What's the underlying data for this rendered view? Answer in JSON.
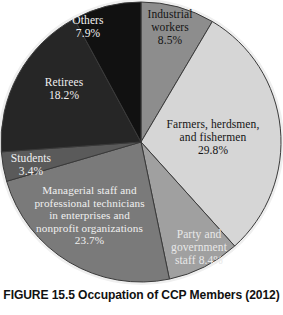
{
  "figure": {
    "caption": "FIGURE 15.5 Occupation of CCP Members (2012)",
    "background": "#ffffff"
  },
  "labels": {
    "industrial": "Industrial\nworkers\n8.5%",
    "farmers": "Farmers, herdsmen,\nand fishermen\n29.8%",
    "party": "Party and\ngovernment\nstaff 8.4%",
    "managerial": "Managerial staff and\nprofessional technicians\nin enterprises and\nnonprofit organizations\n23.7%",
    "students": "Students\n3.4%",
    "retirees": "Retirees\n18.2%",
    "others": "Others\n7.9%"
  },
  "chart_data": {
    "type": "pie",
    "title": "FIGURE 15.5 Occupation of CCP Members (2012)",
    "xlabel": "",
    "ylabel": "",
    "units": "percent",
    "start_angle_deg": 0,
    "direction": "clockwise",
    "legend": "none (labels placed on slices)",
    "categories": [
      "Industrial workers",
      "Farmers, herdsmen, and fishermen",
      "Party and government staff",
      "Managerial staff and professional technicians in enterprises and nonprofit organizations",
      "Students",
      "Retirees",
      "Others"
    ],
    "values": [
      8.5,
      29.8,
      8.4,
      23.7,
      3.4,
      18.2,
      7.9
    ],
    "value_labels": [
      "8.5%",
      "29.8%",
      "8.4%",
      "23.7%",
      "3.4%",
      "18.2%",
      "7.9%"
    ],
    "colors": [
      "#8d8d8d",
      "#d6d6d6",
      "#a0a0a0",
      "#7a7a7a",
      "#5a5a5a",
      "#262626",
      "#111111"
    ],
    "slice_edge_color": "#3a3a3a",
    "outer_rim_color": "#efefef"
  }
}
